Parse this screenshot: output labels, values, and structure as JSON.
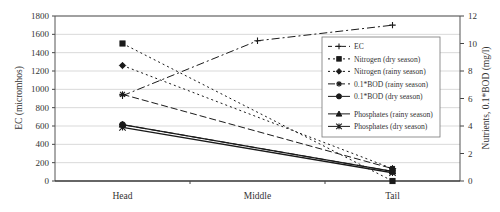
{
  "chart_data": {
    "type": "line",
    "categories": [
      "Head",
      "Middle",
      "Tail"
    ],
    "ylabel_left": "EC (micromhos)",
    "ylabel_right": "Nutrients, 0.1*BOD (mg/l)",
    "ylim_left": [
      0,
      1800
    ],
    "ylim_right": [
      0,
      12
    ],
    "yticks_left": [
      "0",
      "200",
      "400",
      "600",
      "800",
      "1000",
      "1200",
      "1400",
      "1600",
      "1800"
    ],
    "yticks_right": [
      "0",
      "2",
      "4",
      "6",
      "8",
      "10",
      "12"
    ],
    "grid": true,
    "legend_position": "upper right inside",
    "series": [
      {
        "name": "EC",
        "axis": "left",
        "marker": "plus",
        "dash": "8,3,2,3",
        "points": [
          [
            0,
            930
          ],
          [
            1,
            1530
          ],
          [
            2,
            1700
          ]
        ]
      },
      {
        "name": "Nitrogen (dry season)",
        "axis": "right",
        "marker": "square",
        "dash": "2,3",
        "points": [
          [
            0,
            10.0
          ],
          [
            2,
            0.0
          ]
        ]
      },
      {
        "name": "Nitrogen (rainy season)",
        "axis": "right",
        "marker": "diamond",
        "dash": "2,3",
        "points": [
          [
            0,
            8.4
          ],
          [
            2,
            0.9
          ]
        ]
      },
      {
        "name": "0.1*BOD (rainy season)",
        "axis": "right",
        "marker": "star",
        "dash": "7,3",
        "points": [
          [
            0,
            6.3
          ],
          [
            2,
            0.9
          ]
        ]
      },
      {
        "name": "0.1*BOD (dry season)",
        "axis": "right",
        "marker": "circle",
        "dash": "10,4",
        "points": [
          [
            0,
            4.1
          ],
          [
            2,
            0.7
          ]
        ]
      },
      {
        "name": "Phosphates (rainy season)",
        "axis": "right",
        "marker": "triangle",
        "dash": "",
        "points": [
          [
            0,
            4.1
          ],
          [
            2,
            0.7
          ]
        ]
      },
      {
        "name": "Phosphates (dry season)",
        "axis": "right",
        "marker": "x",
        "dash": "",
        "points": [
          [
            0,
            3.9
          ],
          [
            2,
            0.6
          ]
        ]
      }
    ]
  },
  "legend": {
    "items": [
      "EC",
      "Nitrogen (dry season)",
      "Nitrogen (rainy season)",
      "0.1*BOD (rainy season)",
      "0.1*BOD (dry season)",
      "Phosphates (rainy season)",
      "Phosphates (dry season)"
    ]
  },
  "colors": {
    "line": "#1a1a1a",
    "grid": "#d9d9d9",
    "axis": "#444444"
  }
}
